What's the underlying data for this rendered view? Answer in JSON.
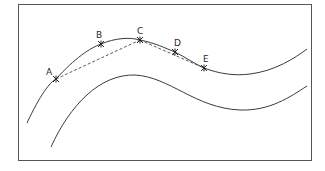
{
  "diagram": {
    "type": "curve-with-points",
    "frame": {
      "x": 18,
      "y": 4,
      "width": 293,
      "height": 156,
      "stroke": "#555555"
    },
    "curves": [
      {
        "name": "upper-curve",
        "path": "M27,123 C40,95 50,82 56,79 C75,58 90,48 101,44 C115,38 130,37 140,40 C155,43 165,48 175,52 C185,57 195,64 204,68 C220,74 235,76 250,74 C275,71 295,58 307,49"
      },
      {
        "name": "lower-curve",
        "path": "M51,147 C70,105 100,74 135,75 C170,77 195,108 240,110 C270,111 290,97 307,86"
      }
    ],
    "points": [
      {
        "label": "A",
        "x": 56,
        "y": 79,
        "lx": 46,
        "ly": 75
      },
      {
        "label": "B",
        "x": 101,
        "y": 44,
        "lx": 96,
        "ly": 38
      },
      {
        "label": "C",
        "x": 140,
        "y": 40,
        "lx": 137,
        "ly": 34
      },
      {
        "label": "D",
        "x": 175,
        "y": 52,
        "lx": 174,
        "ly": 46
      },
      {
        "label": "E",
        "x": 204,
        "y": 68,
        "lx": 203,
        "ly": 62
      }
    ],
    "dashed_chords": [
      {
        "from": "A",
        "to": "C"
      },
      {
        "from": "C",
        "to": "E"
      }
    ],
    "colors": {
      "line": "#3a3a3a",
      "dash": "#4a4a4a"
    }
  }
}
